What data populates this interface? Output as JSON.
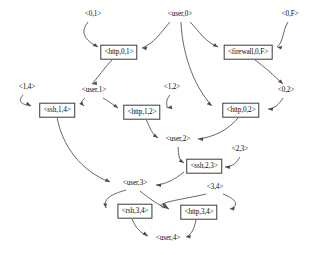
{
  "diagram": {
    "type": "attack-graph",
    "width": 311,
    "height": 255,
    "stroke_color": "#4a4a4a",
    "text_color": "#0a0a0a",
    "background_color": "#ffffff",
    "node_border_color": "#3a3a3a",
    "nodes": [
      {
        "id": "f_0_1",
        "label": "<0,1>",
        "kind": "fact",
        "x": 93,
        "y": 15
      },
      {
        "id": "f_user_0",
        "label": "<user,0>",
        "kind": "fact",
        "x": 180,
        "y": 15
      },
      {
        "id": "f_0_F",
        "label": "<0,F>",
        "kind": "fact",
        "x": 290,
        "y": 15
      },
      {
        "id": "r_http_0_1",
        "label": "<http,0,1>",
        "kind": "rule",
        "x": 119,
        "y": 52
      },
      {
        "id": "r_firewall",
        "label": "<firewall,0,F>",
        "kind": "rule",
        "x": 248,
        "y": 52
      },
      {
        "id": "f_1_4",
        "label": "<1,4>",
        "kind": "fact",
        "x": 27,
        "y": 88
      },
      {
        "id": "f_user_1",
        "label": "<user,1>",
        "kind": "fact",
        "x": 94,
        "y": 91
      },
      {
        "id": "f_1_2",
        "label": "<1,2>",
        "kind": "fact",
        "x": 172,
        "y": 88
      },
      {
        "id": "f_0_2",
        "label": "<0,2>",
        "kind": "fact",
        "x": 286,
        "y": 91
      },
      {
        "id": "r_ssh_1_4",
        "label": "<ssh,1,4>",
        "kind": "rule",
        "x": 57,
        "y": 110
      },
      {
        "id": "r_http_1_2",
        "label": "<http,1,2>",
        "kind": "rule",
        "x": 142,
        "y": 112
      },
      {
        "id": "r_http_0_2",
        "label": "<http,0,2>",
        "kind": "rule",
        "x": 241,
        "y": 110
      },
      {
        "id": "f_user_2",
        "label": "<user,2>",
        "kind": "fact",
        "x": 178,
        "y": 140
      },
      {
        "id": "f_2_3",
        "label": "<2,3>",
        "kind": "fact",
        "x": 240,
        "y": 150
      },
      {
        "id": "r_ssh_2_3",
        "label": "<ssh,2,3>",
        "kind": "rule",
        "x": 204,
        "y": 166
      },
      {
        "id": "f_user_3",
        "label": "<user,3>",
        "kind": "fact",
        "x": 135,
        "y": 184
      },
      {
        "id": "f_3_4",
        "label": "<3,4>",
        "kind": "fact",
        "x": 215,
        "y": 188
      },
      {
        "id": "r_rsh_3_4",
        "label": "<rsh,3,4>",
        "kind": "rule",
        "x": 135,
        "y": 211
      },
      {
        "id": "r_http_3_4",
        "label": "<http,3,4>",
        "kind": "rule",
        "x": 199,
        "y": 212
      },
      {
        "id": "f_user_4",
        "label": "<user,4>",
        "kind": "fact",
        "x": 168,
        "y": 239
      }
    ],
    "edges": [
      {
        "from": "f_0_1",
        "to": "r_http_0_1"
      },
      {
        "from": "f_user_0",
        "to": "r_http_0_1"
      },
      {
        "from": "f_user_0",
        "to": "r_firewall"
      },
      {
        "from": "f_user_0",
        "to": "r_http_0_2"
      },
      {
        "from": "f_0_F",
        "to": "r_firewall"
      },
      {
        "from": "r_http_0_1",
        "to": "f_user_1"
      },
      {
        "from": "r_firewall",
        "to": "f_0_2"
      },
      {
        "from": "f_1_4",
        "to": "r_ssh_1_4"
      },
      {
        "from": "f_user_1",
        "to": "r_ssh_1_4"
      },
      {
        "from": "f_user_1",
        "to": "r_http_1_2"
      },
      {
        "from": "f_1_2",
        "to": "r_http_1_2"
      },
      {
        "from": "f_0_2",
        "to": "r_http_0_2"
      },
      {
        "from": "r_ssh_1_4",
        "to": "f_user_3"
      },
      {
        "from": "r_http_1_2",
        "to": "f_user_2"
      },
      {
        "from": "r_http_0_2",
        "to": "f_user_2"
      },
      {
        "from": "f_user_2",
        "to": "r_ssh_2_3"
      },
      {
        "from": "f_2_3",
        "to": "r_ssh_2_3"
      },
      {
        "from": "r_ssh_2_3",
        "to": "f_user_3"
      },
      {
        "from": "f_user_3",
        "to": "r_rsh_3_4"
      },
      {
        "from": "f_user_3",
        "to": "r_http_3_4"
      },
      {
        "from": "f_3_4",
        "to": "r_rsh_3_4"
      },
      {
        "from": "f_3_4",
        "to": "r_http_3_4"
      },
      {
        "from": "r_rsh_3_4",
        "to": "f_user_4"
      },
      {
        "from": "r_http_3_4",
        "to": "f_user_4"
      }
    ]
  }
}
